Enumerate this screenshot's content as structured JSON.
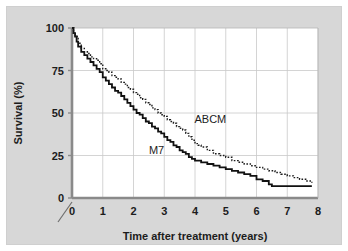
{
  "figure": {
    "background_color": "#d7d7d7",
    "plot_background_color": "#ffffff",
    "grid_color": "#c9c9c9",
    "axis_color": "#8a8a8a",
    "text_color": "#1c1c1c"
  },
  "chart_data": {
    "type": "line",
    "title": "",
    "subtitle": "",
    "xlabel": "Time after treatment (years)",
    "ylabel": "Survival (%)",
    "xlim": [
      0,
      8
    ],
    "ylim": [
      0,
      100
    ],
    "xticks": [
      "0",
      "1",
      "2",
      "3",
      "4",
      "5",
      "6",
      "7",
      "8"
    ],
    "yticks": [
      "0",
      "25",
      "50",
      "75",
      "100"
    ],
    "grid": "both",
    "legend_position": "inline-annotations",
    "axis_break_at_origin": true,
    "annotations": [
      {
        "text": "ABCM",
        "x": 4.5,
        "y": 44
      },
      {
        "text": "M7",
        "x": 2.75,
        "y": 26
      }
    ],
    "series": [
      {
        "name": "M7",
        "style": "solid",
        "color": "#111111",
        "line_width": 1.8,
        "step": true,
        "x": [
          0.0,
          0.05,
          0.1,
          0.15,
          0.2,
          0.3,
          0.4,
          0.5,
          0.6,
          0.7,
          0.8,
          0.9,
          1.0,
          1.1,
          1.2,
          1.3,
          1.4,
          1.5,
          1.6,
          1.7,
          1.8,
          1.9,
          2.0,
          2.1,
          2.2,
          2.3,
          2.4,
          2.5,
          2.6,
          2.7,
          2.8,
          2.9,
          3.0,
          3.1,
          3.2,
          3.3,
          3.4,
          3.5,
          3.6,
          3.7,
          3.8,
          3.9,
          4.0,
          4.2,
          4.4,
          4.6,
          4.8,
          5.0,
          5.2,
          5.4,
          5.6,
          5.8,
          6.0,
          6.2,
          6.4,
          6.5,
          6.8,
          7.2,
          7.8
        ],
        "y": [
          100,
          97,
          95,
          92,
          89,
          86,
          84,
          82,
          80,
          78,
          76,
          74,
          71,
          69,
          67,
          65,
          63,
          62,
          60,
          58,
          56,
          54,
          52,
          50,
          49,
          47,
          45,
          44,
          42,
          41,
          39,
          38,
          36,
          34,
          33,
          31,
          30,
          28,
          27,
          26,
          24,
          23,
          22,
          21,
          20,
          19,
          18,
          17,
          16,
          15,
          14,
          13,
          11,
          10,
          8,
          7,
          7,
          7,
          7
        ]
      },
      {
        "name": "ABCM",
        "style": "dotted",
        "color": "#1c1c1c",
        "line_width": 1.4,
        "step": true,
        "x": [
          0.0,
          0.05,
          0.1,
          0.2,
          0.3,
          0.4,
          0.5,
          0.6,
          0.7,
          0.8,
          0.9,
          1.0,
          1.1,
          1.2,
          1.3,
          1.4,
          1.5,
          1.6,
          1.7,
          1.8,
          1.9,
          2.0,
          2.1,
          2.2,
          2.3,
          2.4,
          2.5,
          2.6,
          2.7,
          2.8,
          2.9,
          3.0,
          3.1,
          3.2,
          3.3,
          3.4,
          3.5,
          3.6,
          3.7,
          3.8,
          3.9,
          4.0,
          4.1,
          4.2,
          4.4,
          4.6,
          4.8,
          5.0,
          5.2,
          5.4,
          5.6,
          5.8,
          6.0,
          6.2,
          6.4,
          6.6,
          6.8,
          7.0,
          7.2,
          7.4,
          7.6,
          7.8
        ],
        "y": [
          100,
          97,
          95,
          91,
          88,
          86,
          85,
          83,
          82,
          81,
          79,
          76,
          75,
          74,
          72,
          71,
          70,
          68,
          67,
          65,
          64,
          62,
          61,
          59,
          58,
          56,
          55,
          53,
          52,
          50,
          49,
          48,
          46,
          45,
          44,
          42,
          41,
          40,
          38,
          36,
          34,
          32,
          31,
          30,
          28,
          26,
          25,
          24,
          22,
          21,
          20,
          19,
          18,
          17,
          16,
          15,
          14,
          13,
          12,
          11,
          10,
          9
        ]
      }
    ]
  }
}
